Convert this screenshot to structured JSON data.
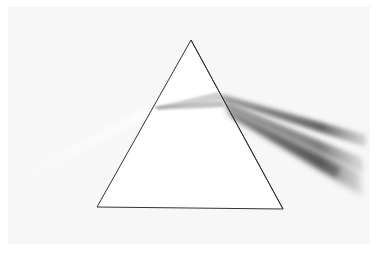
{
  "image": {
    "subject": "triangular prism dispersing a beam of light",
    "colors": {
      "background": "#ffffff",
      "panel": "#f7f7f7",
      "prism_fill": "#ffffff",
      "prism_outline": "#333333",
      "incident_beam": "#ffffff",
      "dispersed_beam": "#555555"
    },
    "prism": {
      "apex": [
        191,
        40
      ],
      "bottom_left": [
        97,
        207
      ],
      "bottom_right": [
        283,
        209
      ]
    }
  }
}
